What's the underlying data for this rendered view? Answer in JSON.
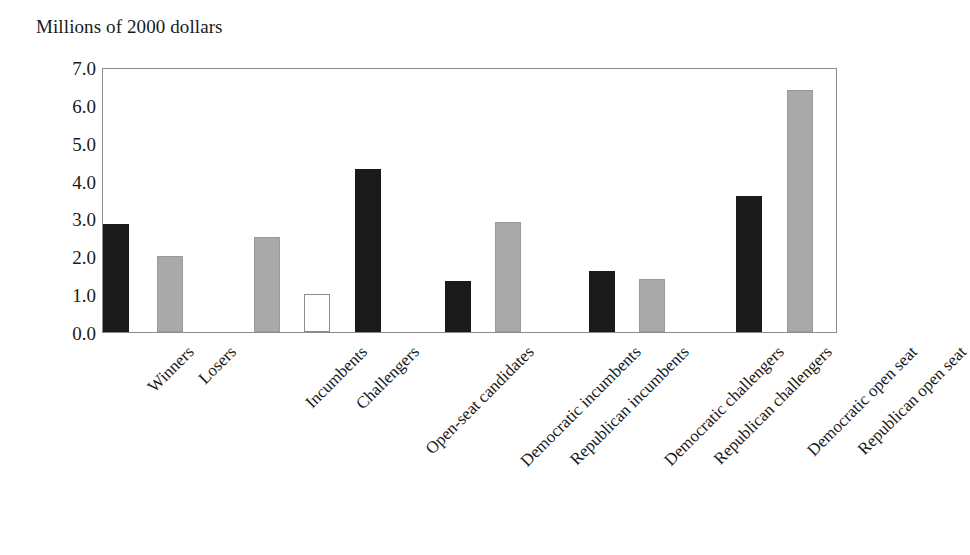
{
  "chart_data": {
    "type": "bar",
    "title": "Millions of 2000 dollars",
    "xlabel": "",
    "ylabel": "Millions of 2000 dollars",
    "ylim": [
      0.0,
      7.0
    ],
    "ytick_labels": [
      "7.0",
      "6.0",
      "5.0",
      "4.0",
      "3.0",
      "2.0",
      "1.0",
      "0.0"
    ],
    "ytick_values": [
      7.0,
      6.0,
      5.0,
      4.0,
      3.0,
      2.0,
      1.0,
      0.0
    ],
    "grid": false,
    "legend": "none",
    "legend_position": "none",
    "categories": [
      "Winners",
      "Losers",
      "Incumbents",
      "Challengers",
      "Open-seat candidates",
      "Democratic incumbents",
      "Republican incumbents",
      "Democratic challengers",
      "Republican challengers",
      "Democratic open seat",
      "Republican open seat"
    ],
    "values": [
      2.85,
      2.0,
      2.5,
      1.0,
      4.3,
      1.35,
      2.9,
      1.6,
      1.4,
      3.6,
      6.4
    ],
    "bar_styles": [
      "dark",
      "gray",
      "gray",
      "white",
      "dark",
      "dark",
      "gray",
      "dark",
      "gray",
      "dark",
      "gray"
    ],
    "groups": [
      [
        "Winners",
        "Losers"
      ],
      [
        "Incumbents",
        "Challengers",
        "Open-seat candidates"
      ],
      [
        "Democratic incumbents",
        "Republican incumbents"
      ],
      [
        "Democratic challengers",
        "Republican challengers"
      ],
      [
        "Democratic open seat",
        "Republican open seat"
      ]
    ]
  },
  "colors": {
    "dark": "#1a1a1a",
    "gray": "#a9a9a9",
    "white": "#ffffff",
    "axis": "#8c8c8c",
    "text": "#1a1a1a",
    "background": "#ffffff"
  },
  "geometry": {
    "plot_left": 102,
    "plot_top": 68,
    "plot_width": 735,
    "plot_height": 265,
    "bar_width": 26,
    "bar_centers": [
      115,
      169,
      266,
      316,
      367,
      457,
      507,
      601,
      651,
      748,
      799
    ]
  }
}
